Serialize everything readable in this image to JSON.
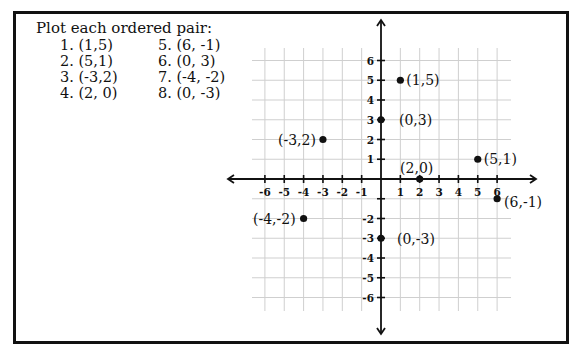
{
  "instructions": {
    "title": "Plot each ordered pair:",
    "items": [
      {
        "label": "1. (1,5)"
      },
      {
        "label": "2. (5,1)"
      },
      {
        "label": "3. (-3,2)"
      },
      {
        "label": "4. (2, 0)"
      },
      {
        "label": "5. (6, -1)"
      },
      {
        "label": "6. (0, 3)"
      },
      {
        "label": "7. (-4, -2)"
      },
      {
        "label": "8. (0, -3)"
      }
    ]
  },
  "chart_data": {
    "type": "scatter",
    "title": "Plot each ordered pair:",
    "xlabel": "",
    "ylabel": "",
    "xlim": [
      -6,
      6
    ],
    "ylim": [
      -6,
      6
    ],
    "grid": true,
    "x_ticks": [
      -6,
      -5,
      -4,
      -3,
      -2,
      -1,
      1,
      2,
      3,
      4,
      5,
      6
    ],
    "y_ticks": [
      6,
      5,
      4,
      3,
      2,
      1,
      -2,
      -3,
      -4,
      -5,
      -6
    ],
    "points": [
      {
        "x": 1,
        "y": 5,
        "label": "(1,5)"
      },
      {
        "x": 5,
        "y": 1,
        "label": "(5,1)"
      },
      {
        "x": -3,
        "y": 2,
        "label": "(-3,2)"
      },
      {
        "x": 2,
        "y": 0,
        "label": "(2,0)"
      },
      {
        "x": 6,
        "y": -1,
        "label": "(6,-1)"
      },
      {
        "x": 0,
        "y": 3,
        "label": "(0,3)"
      },
      {
        "x": -4,
        "y": -2,
        "label": "(-4,-2)"
      },
      {
        "x": 0,
        "y": -3,
        "label": "(0,-3)"
      }
    ]
  },
  "colors": {
    "ink": "#111111",
    "grid": "#cfcfcf",
    "background": "#ffffff"
  }
}
